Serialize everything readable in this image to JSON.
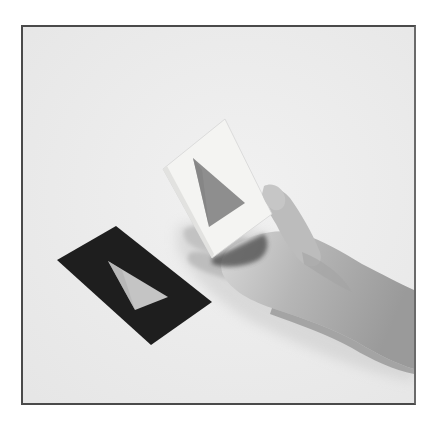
{
  "image": {
    "kind": "photograph",
    "tone": "grayscale",
    "subject": "Hand holding a white card with a gray triangle cutout beside a black card with a light triangle cutout",
    "frame": {
      "border_color": "#4a4a4a",
      "background_color": "#ececec"
    },
    "objects": {
      "black_card": {
        "fill": "#1e1e1e",
        "triangle_fill": "#c4c4c4"
      },
      "white_card": {
        "fill": "#f4f4f2",
        "triangle_fill": "#8e8e8e"
      },
      "hand": {
        "fill": "#b8b8b8"
      }
    }
  }
}
